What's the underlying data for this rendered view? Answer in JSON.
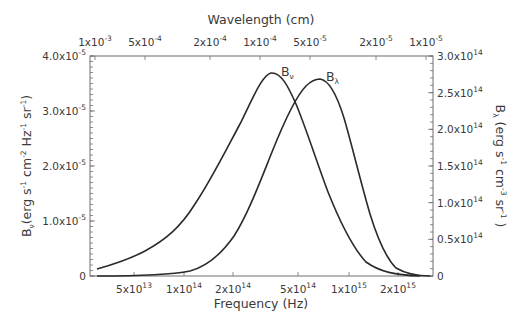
{
  "chart_data": {
    "type": "line",
    "title": "",
    "xlabel": "Frequency (Hz)",
    "x2label": "Wavelength (cm)",
    "ylabel_left": "Bν (erg s⁻¹ cm⁻² Hz⁻¹ sr⁻¹)",
    "ylabel_right": "Bλ (erg s⁻¹ cm⁻³ sr⁻¹)",
    "xscale": "log",
    "grid": false,
    "legend": "inline labels at curve peaks",
    "x_ticks": [
      {
        "label_base": "5x10",
        "label_exp": "13",
        "value": 50000000000000.0
      },
      {
        "label_base": "1x10",
        "label_exp": "14",
        "value": 100000000000000.0
      },
      {
        "label_base": "2x10",
        "label_exp": "14",
        "value": 200000000000000.0
      },
      {
        "label_base": "5x10",
        "label_exp": "14",
        "value": 500000000000000.0
      },
      {
        "label_base": "1x10",
        "label_exp": "15",
        "value": 1000000000000000.0
      },
      {
        "label_base": "2x10",
        "label_exp": "15",
        "value": 2000000000000000.0
      }
    ],
    "x2_ticks": [
      {
        "label_base": "1x10",
        "label_exp": "-3",
        "value": 0.001
      },
      {
        "label_base": "5x10",
        "label_exp": "-4",
        "value": 0.0005
      },
      {
        "label_base": "2x10",
        "label_exp": "-4",
        "value": 0.0002
      },
      {
        "label_base": "1x10",
        "label_exp": "-4",
        "value": 0.0001
      },
      {
        "label_base": "5x10",
        "label_exp": "-5",
        "value": 5e-05
      },
      {
        "label_base": "2x10",
        "label_exp": "-5",
        "value": 2e-05
      },
      {
        "label_base": "1x10",
        "label_exp": "-5",
        "value": 1e-05
      }
    ],
    "y_left_ticks": [
      {
        "label_base": "0",
        "label_exp": "",
        "value": 0
      },
      {
        "label_base": "1.0x10",
        "label_exp": "-5",
        "value": 1e-05
      },
      {
        "label_base": "2.0x10",
        "label_exp": "-5",
        "value": 2e-05
      },
      {
        "label_base": "3.0x10",
        "label_exp": "-5",
        "value": 3e-05
      },
      {
        "label_base": "4.0x10",
        "label_exp": "-5",
        "value": 4e-05
      }
    ],
    "y_right_ticks": [
      {
        "label_base": "0",
        "label_exp": "",
        "value": 0
      },
      {
        "label_base": "0.5x10",
        "label_exp": "14",
        "value": 50000000000000.0
      },
      {
        "label_base": "1.0x10",
        "label_exp": "14",
        "value": 100000000000000.0
      },
      {
        "label_base": "1.5x10",
        "label_exp": "14",
        "value": 150000000000000.0
      },
      {
        "label_base": "2.0x10",
        "label_exp": "14",
        "value": 200000000000000.0
      },
      {
        "label_base": "2.5x10",
        "label_exp": "14",
        "value": 250000000000000.0
      },
      {
        "label_base": "3.0x10",
        "label_exp": "14",
        "value": 300000000000000.0
      }
    ],
    "ylim_left": [
      0,
      4e-05
    ],
    "ylim_right": [
      0,
      300000000000000.0
    ],
    "xlim": [
      35000000000000.0,
      3000000000000000.0
    ],
    "series": [
      {
        "name": "Bν",
        "label_main": "B",
        "label_sub": "ν",
        "axis": "left",
        "x": [
          35000000000000.0,
          50000000000000.0,
          70000000000000.0,
          100000000000000.0,
          140000000000000.0,
          190000000000000.0,
          230000000000000.0,
          260000000000000.0,
          290000000000000.0,
          340000000000000.0,
          410000000000000.0,
          530000000000000.0,
          690000000000000.0,
          900000000000000.0,
          1300000000000000.0,
          1900000000000000.0,
          3000000000000000.0
        ],
        "values": [
          1.3e-06,
          3.3e-06,
          6.6e-06,
          1.2e-05,
          2e-05,
          2.9e-05,
          3.5e-05,
          3.68e-05,
          3.6e-05,
          3.2e-05,
          2.5e-05,
          1.5e-05,
          6.7e-06,
          2e-06,
          3e-07,
          0,
          0
        ]
      },
      {
        "name": "Bλ",
        "label_main": "B",
        "label_sub": "λ",
        "axis": "right",
        "x": [
          35000000000000.0,
          100000000000000.0,
          160000000000000.0,
          220000000000000.0,
          290000000000000.0,
          350000000000000.0,
          410000000000000.0,
          480000000000000.0,
          570000000000000.0,
          630000000000000.0,
          720000000000000.0,
          820000000000000.0,
          960000000000000.0,
          1200000000000000.0,
          1400000000000000.0,
          1900000000000000.0,
          3000000000000000.0
        ],
        "values": [
          0,
          1400000000000.0,
          5500000000000.0,
          19000000000000.0,
          55000000000000.0,
          124000000000000.0,
          194000000000000.0,
          245000000000000.0,
          268000000000000.0,
          264000000000000.0,
          240000000000000.0,
          207000000000000.0,
          157000000000000.0,
          95000000000000.0,
          46000000000000.0,
          8000000000000.0,
          0
        ]
      }
    ]
  },
  "plot_px": {
    "left": 90,
    "right": 433,
    "top": 56,
    "bottom": 276,
    "x_tick_px": [
      134,
      184,
      233,
      298,
      349,
      398
    ],
    "x2_tick_px": [
      95,
      145,
      210,
      260,
      310,
      376,
      426
    ],
    "curve_px": {
      "Bν": "M97,269 C115,264 130,259 145,251 C165,240 180,228 195,204 C210,182 225,152 240,124 C252,100 262,75 271,73 C281,72 288,86 296,104 C306,128 316,160 328,192 C340,222 352,247 366,262 C380,272 395,275 420,276",
      "Bλ": "M97,276 C140,276 170,275 190,271 C205,267 220,256 234,236 C248,214 260,182 272,152 C284,122 296,96 306,86 C312,80 316,79 320,79 C328,80 336,92 344,118 C352,145 360,180 370,214 C378,240 386,258 396,268 C408,275 420,276 430,276"
    },
    "peak_label_px": {
      "Bν": {
        "x": 281,
        "y": 76
      },
      "Bλ": {
        "x": 326,
        "y": 81
      }
    }
  }
}
